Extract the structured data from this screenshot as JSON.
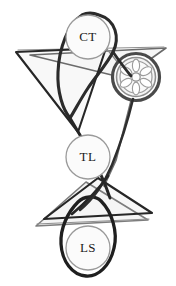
{
  "figure": {
    "title": "",
    "background_color": "#ffffff",
    "width": 176,
    "height": 286
  },
  "palette": {
    "dark_stroke": "#262626",
    "mid_stroke": "#4a4a4a",
    "gray_stroke": "#8c8c8c",
    "light_gray_stroke": "#b0b0b0",
    "node_fill": "#fbfbfb",
    "node_outline": "#9a9a9a",
    "label_color": "#1a1a1a",
    "panel_fill": "#f7f7f7"
  },
  "nodes": [
    {
      "id": "node-ct",
      "label": "CT",
      "cx": 88,
      "cy": 37,
      "r": 22,
      "label_x": 88,
      "label_y": 38
    },
    {
      "id": "node-tl",
      "label": "TL",
      "cx": 88,
      "cy": 157,
      "r": 22,
      "label_x": 88,
      "label_y": 158
    },
    {
      "id": "node-ls",
      "label": "LS",
      "cx": 88,
      "cy": 248,
      "r": 22,
      "label_x": 88,
      "label_y": 249
    }
  ],
  "wheel": {
    "id": "wheel-hub",
    "cx": 136,
    "cy": 77,
    "outer_r": 24,
    "rim_r": 20,
    "inner_r": 15,
    "hub_r": 4,
    "spoke_count": 6
  },
  "loops": [
    {
      "id": "loop-top-teardrop",
      "description": "teardrop loop enclosing CT node, tail descending to lower right"
    },
    {
      "id": "loop-bottom-teardrop",
      "description": "inverted teardrop loop enclosing LS node, tail ascending"
    },
    {
      "id": "loop-wheel-ring",
      "description": "thick ring encircling the wheel hub"
    }
  ],
  "triangles": [
    {
      "id": "triangle-upper-left",
      "stroke": "#262626",
      "points": "16,52 106,48 78,132"
    },
    {
      "id": "triangle-upper-right",
      "stroke": "#6b6b6b",
      "points": "30,55 166,48 124,78"
    },
    {
      "id": "triangle-lower-dark",
      "stroke": "#262626",
      "points": "98,178 44,219 152,213"
    },
    {
      "id": "triangle-lower-gray",
      "stroke": "#7d7d7d",
      "points": "86,182 36,226 148,220"
    }
  ],
  "connector_lines": [
    {
      "id": "edge-ct-tl-left",
      "stroke": "#262626"
    },
    {
      "id": "edge-ct-wheel",
      "stroke": "#2e2e2e"
    },
    {
      "id": "edge-wheel-tl",
      "stroke": "#4a4a4a"
    },
    {
      "id": "edge-tl-ls-cross",
      "stroke": "#262626"
    },
    {
      "id": "edge-horizontal-upper",
      "stroke": "#5a5a5a"
    },
    {
      "id": "edge-horizontal-lower",
      "stroke": "#7d7d7d"
    }
  ]
}
